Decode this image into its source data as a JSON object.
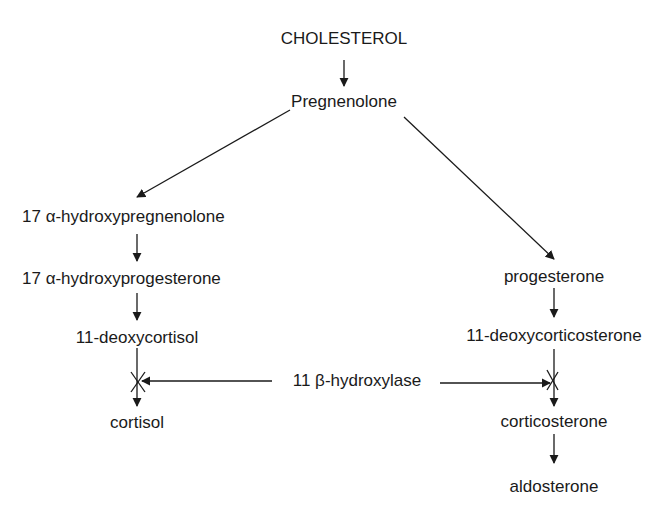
{
  "diagram": {
    "type": "steroid-biosynthesis-pathway",
    "nodes": {
      "cholesterol": "CHOLESTEROL",
      "pregnenolone": "Pregnenolone",
      "hydroxypregnenolone": "17 α-hydroxypregnenolone",
      "hydroxyprogesterone": "17 α-hydroxyprogesterone",
      "deoxycortisol": "11-deoxycortisol",
      "cortisol": "cortisol",
      "progesterone": "progesterone",
      "deoxycorticosterone": "11-deoxycorticosterone",
      "corticosterone": "corticosterone",
      "aldosterone": "aldosterone"
    },
    "enzyme": "11 β-hydroxylase",
    "edges": [
      [
        "cholesterol",
        "pregnenolone"
      ],
      [
        "pregnenolone",
        "hydroxypregnenolone"
      ],
      [
        "pregnenolone",
        "progesterone"
      ],
      [
        "hydroxypregnenolone",
        "hydroxyprogesterone"
      ],
      [
        "hydroxyprogesterone",
        "deoxycortisol"
      ],
      [
        "deoxycortisol",
        "cortisol",
        "blocked by 11 β-hydroxylase deficiency"
      ],
      [
        "progesterone",
        "deoxycorticosterone"
      ],
      [
        "deoxycorticosterone",
        "corticosterone",
        "blocked by 11 β-hydroxylase deficiency"
      ],
      [
        "corticosterone",
        "aldosterone"
      ]
    ],
    "colors": {
      "line": "#1a1a1a",
      "background": "#ffffff"
    }
  }
}
